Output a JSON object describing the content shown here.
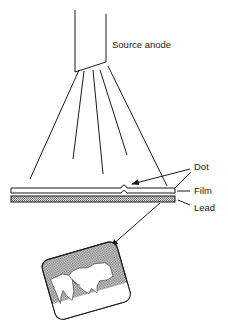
{
  "diagram": {
    "type": "dental x-ray setup",
    "labels": {
      "source": "Source anode",
      "dot": "Dot",
      "film": "Film",
      "lead": "Lead"
    },
    "colors": {
      "ink": "#1a1a1a",
      "hatch": "#9a9a9a",
      "background": "#ffffff"
    }
  }
}
